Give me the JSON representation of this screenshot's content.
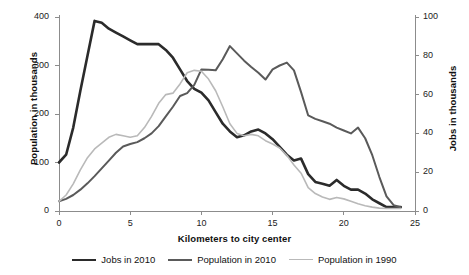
{
  "chart_data": {
    "type": "line",
    "title": "",
    "xlabel": "Kilometers to city center",
    "ylabel": "Population in thousands",
    "y2label": "Jobs in thousands",
    "xlim": [
      0,
      25
    ],
    "ylim": [
      0,
      400
    ],
    "y2lim": [
      0,
      100
    ],
    "grid": false,
    "legend_position": "bottom",
    "x_ticks": [
      "0",
      "5",
      "10",
      "15",
      "20",
      "25"
    ],
    "y_ticks": [
      "0",
      "100",
      "200",
      "300",
      "400"
    ],
    "y2_ticks": [
      "0",
      "20",
      "40",
      "60",
      "80",
      "100"
    ],
    "series": [
      {
        "name": "Jobs in 2010",
        "color": "#2b2b2b",
        "axis": "right",
        "x": [
          0,
          0.5,
          1,
          1.5,
          2,
          2.5,
          3,
          3.5,
          4,
          4.5,
          5,
          5.5,
          6,
          6.5,
          7,
          7.5,
          8,
          8.5,
          9,
          9.5,
          10,
          10.5,
          11,
          11.5,
          12,
          12.5,
          13,
          13.5,
          14,
          14.5,
          15,
          15.5,
          16,
          16.5,
          17,
          17.5,
          18,
          18.5,
          19,
          19.5,
          20,
          20.5,
          21,
          21.5,
          22,
          22.5,
          23,
          23.5,
          24
        ],
        "values": [
          25,
          29,
          43,
          62,
          80,
          98,
          97,
          94,
          92,
          90,
          88,
          86,
          86,
          86,
          86,
          83,
          79,
          73,
          67,
          63,
          61,
          57,
          51,
          45,
          41,
          38,
          39,
          41,
          42,
          40,
          37,
          33,
          29,
          26,
          27,
          19,
          15,
          14,
          13,
          16,
          13,
          11,
          11,
          9,
          6,
          4,
          2,
          2,
          2
        ],
        "values_left_scale": [
          100,
          115,
          170,
          248,
          318,
          392,
          387,
          375,
          368,
          360,
          352,
          345,
          344,
          344,
          344,
          332,
          315,
          291,
          269,
          252,
          243,
          227,
          203,
          180,
          164,
          153,
          155,
          163,
          168,
          160,
          148,
          133,
          116,
          105,
          107,
          77,
          61,
          55,
          53,
          63,
          51,
          46,
          45,
          35,
          24,
          15,
          8,
          8,
          9
        ]
      },
      {
        "name": "Population in 2010",
        "color": "#5a5a5a",
        "axis": "left",
        "x": [
          0,
          0.5,
          1,
          1.5,
          2,
          2.5,
          3,
          3.5,
          4,
          4.5,
          5,
          5.5,
          6,
          6.5,
          7,
          7.5,
          8,
          8.5,
          9,
          9.5,
          10,
          10.5,
          11,
          11.5,
          12,
          12.5,
          13,
          13.5,
          14,
          14.5,
          15,
          15.5,
          16,
          16.5,
          17,
          17.5,
          18,
          18.5,
          19,
          19.5,
          20,
          20.5,
          21,
          21.5,
          22,
          22.5,
          23,
          23.5,
          24
        ],
        "values": [
          20,
          25,
          33,
          44,
          57,
          72,
          88,
          104,
          120,
          133,
          138,
          142,
          150,
          160,
          175,
          195,
          215,
          237,
          243,
          260,
          292,
          291,
          290,
          313,
          340,
          325,
          310,
          297,
          285,
          271,
          292,
          300,
          306,
          290,
          245,
          197,
          190,
          185,
          180,
          172,
          166,
          160,
          172,
          150,
          115,
          70,
          30,
          12,
          8
        ]
      },
      {
        "name": "Population in 1990",
        "color": "#b9b9b9",
        "axis": "left",
        "x": [
          0,
          0.5,
          1,
          1.5,
          2,
          2.5,
          3,
          3.5,
          4,
          4.5,
          5,
          5.5,
          6,
          6.5,
          7,
          7.5,
          8,
          8.5,
          9,
          9.5,
          10,
          10.5,
          11,
          11.5,
          12,
          12.5,
          13,
          13.5,
          14,
          14.5,
          15,
          15.5,
          16,
          16.5,
          17,
          17.5,
          18,
          18.5,
          19,
          19.5,
          20,
          20.5,
          21,
          21.5,
          22,
          22.5,
          23,
          23.5,
          24
        ],
        "values": [
          20,
          33,
          56,
          85,
          110,
          128,
          140,
          152,
          158,
          155,
          152,
          155,
          172,
          195,
          222,
          240,
          243,
          262,
          285,
          290,
          288,
          272,
          248,
          215,
          180,
          160,
          155,
          158,
          155,
          145,
          138,
          130,
          115,
          95,
          78,
          48,
          36,
          29,
          24,
          28,
          25,
          20,
          15,
          11,
          8,
          6,
          5,
          5,
          5
        ]
      }
    ]
  },
  "axes": {
    "left": {
      "title": "Population in thousands",
      "ticks": [
        {
          "label": "400",
          "value": 400
        },
        {
          "label": "300",
          "value": 300
        },
        {
          "label": "200",
          "value": 200
        },
        {
          "label": "100",
          "value": 100
        },
        {
          "label": "0",
          "value": 0
        }
      ]
    },
    "right": {
      "title": "Jobs in thousands",
      "ticks": [
        {
          "label": "100",
          "value": 100
        },
        {
          "label": "80",
          "value": 80
        },
        {
          "label": "60",
          "value": 60
        },
        {
          "label": "40",
          "value": 40
        },
        {
          "label": "20",
          "value": 20
        },
        {
          "label": "0",
          "value": 0
        }
      ]
    },
    "bottom": {
      "title": "Kilometers to city center",
      "ticks": [
        {
          "label": "0",
          "value": 0
        },
        {
          "label": "5",
          "value": 5
        },
        {
          "label": "10",
          "value": 10
        },
        {
          "label": "15",
          "value": 15
        },
        {
          "label": "20",
          "value": 20
        },
        {
          "label": "25",
          "value": 25
        }
      ]
    }
  },
  "legend": {
    "items": [
      {
        "label": "Jobs in 2010",
        "color": "#2b2b2b",
        "width": 2.6
      },
      {
        "label": "Population in 2010",
        "color": "#5a5a5a",
        "width": 2.0
      },
      {
        "label": "Population in 1990",
        "color": "#b9b9b9",
        "width": 1.6
      }
    ]
  },
  "colors": {
    "axis": "#8c8c8c",
    "text": "#1a1a1a",
    "background": "#ffffff"
  }
}
